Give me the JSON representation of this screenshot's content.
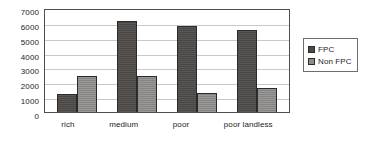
{
  "chart_data": {
    "type": "bar",
    "title": "",
    "subtitle": "",
    "xlabel": "",
    "ylabel": "",
    "categories": [
      "rich",
      "medium",
      "poor",
      "poor landless"
    ],
    "series": [
      {
        "name": "FPC",
        "values": [
          1200,
          6100,
          5800,
          5500
        ],
        "color": "#4d4a48"
      },
      {
        "name": "Non FPC",
        "values": [
          2400,
          2400,
          1250,
          1600
        ],
        "color": "#8e8c8a"
      }
    ],
    "ylim": [
      0,
      7000
    ],
    "ytick_labels": [
      "7000",
      "6000",
      "5000",
      "4000",
      "3000",
      "2000",
      "1000",
      "0"
    ],
    "ytick_values": [
      7000,
      6000,
      5000,
      4000,
      3000,
      2000,
      1000,
      0
    ],
    "ytick_step": 1000,
    "grid": true,
    "grid_axis": "y",
    "legend_position": "right",
    "legend_entries": [
      "FPC",
      "Non FPC"
    ],
    "plot_border_color": "#4e4e4e",
    "gridline_color": "#c9c9c9",
    "background_color": "#ffffff"
  }
}
